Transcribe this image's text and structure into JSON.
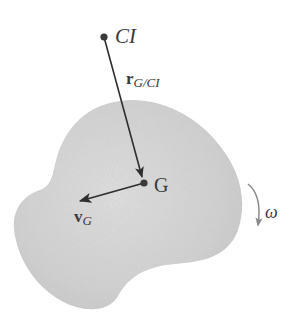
{
  "diagram": {
    "type": "rigid-body-kinematics",
    "body": {
      "fill": "#d4d4d4",
      "shade": "#c4c4c4"
    },
    "points": {
      "ci": {
        "label": "CI",
        "x": 104,
        "y": 37
      },
      "g": {
        "label": "G",
        "x": 144,
        "y": 183
      }
    },
    "vectors": {
      "r_g_ci": {
        "label_main": "r",
        "label_sub": "G/CI",
        "from": "CI",
        "to": "G"
      },
      "v_g": {
        "label_main": "v",
        "label_sub": "G",
        "from": "G"
      }
    },
    "rotation": {
      "label": "ω",
      "direction": "clockwise"
    },
    "colors": {
      "ink": "#3a3a3a",
      "arrow": "#2e2e2e",
      "omega_arrow": "#8a8a8a"
    }
  }
}
